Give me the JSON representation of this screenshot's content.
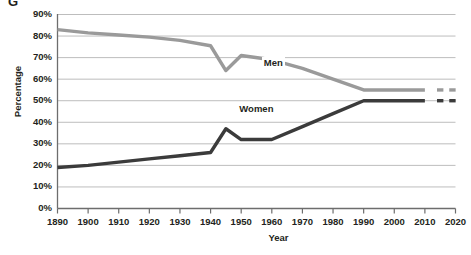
{
  "figure": {
    "caption_fragment": "G",
    "ylabel": "Percentage",
    "xlabel": "Year"
  },
  "colors": {
    "men_line": "#9a9a9a",
    "women_line": "#3b3b3b",
    "grid": "#bdbdbd",
    "axis": "#6d6d6d",
    "text": "#231f20",
    "background": "#ffffff"
  },
  "chart_data": {
    "type": "line",
    "title": "",
    "xlabel": "Year",
    "ylabel": "Percentage",
    "xlim": [
      1890,
      2020
    ],
    "ylim": [
      0,
      90
    ],
    "grid": true,
    "legend_position": "inline-labels",
    "xticks": [
      1890,
      1900,
      1910,
      1920,
      1930,
      1940,
      1950,
      1960,
      1970,
      1980,
      1990,
      2000,
      2010,
      2020
    ],
    "xticklabels": [
      "1890",
      "1900",
      "1910",
      "1920",
      "1930",
      "1940",
      "1950",
      "1960",
      "1970",
      "1980",
      "1990",
      "2000",
      "2010",
      "2020"
    ],
    "yticks": [
      0,
      10,
      20,
      30,
      40,
      50,
      60,
      70,
      80,
      90
    ],
    "yticklabels": [
      "0%",
      "10%",
      "20%",
      "30%",
      "40%",
      "50%",
      "60%",
      "70%",
      "80%",
      "90%"
    ],
    "series": [
      {
        "name": "Men",
        "color": "#9a9a9a",
        "label_text": "Men",
        "x": [
          1890,
          1900,
          1910,
          1920,
          1930,
          1940,
          1945,
          1950,
          1960,
          1970,
          1980,
          1990,
          2000,
          2010
        ],
        "values": [
          83,
          81.5,
          80.5,
          79.5,
          78,
          75.5,
          64,
          71,
          69,
          65,
          60,
          55,
          55,
          55
        ],
        "projection_dashes": [
          2015,
          2019
        ]
      },
      {
        "name": "Women",
        "color": "#3b3b3b",
        "label_text": "Women",
        "x": [
          1890,
          1900,
          1910,
          1920,
          1930,
          1940,
          1945,
          1950,
          1960,
          1970,
          1980,
          1990,
          2000,
          2010
        ],
        "values": [
          19,
          20,
          21.5,
          23,
          24.5,
          26,
          37,
          32,
          32,
          38,
          44,
          50,
          50,
          50
        ],
        "projection_dashes": [
          2015,
          2019
        ]
      }
    ],
    "annotations": [
      {
        "text": "Men",
        "x": 1960,
        "y": 67.5
      },
      {
        "text": "Women",
        "x": 1952,
        "y": 46
      }
    ]
  }
}
